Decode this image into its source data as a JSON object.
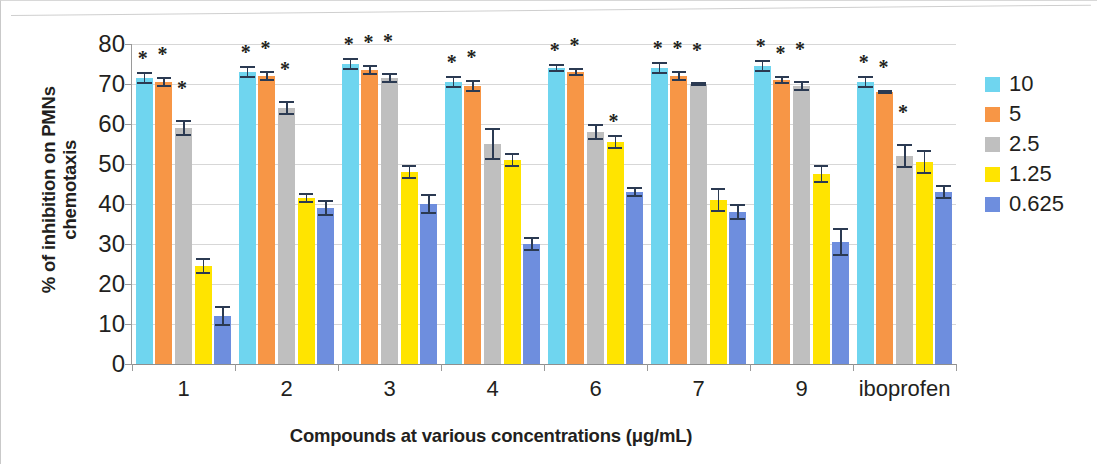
{
  "chart_data": {
    "type": "bar",
    "title": "",
    "xlabel": "Compounds at various concentrations (μg/mL)",
    "ylabel": "% of inhibition on PMNs chemotaxis",
    "ylabel_line1": "% of inhibition on PMNs",
    "ylabel_line2": "chemotaxis",
    "categories": [
      "1",
      "2",
      "3",
      "4",
      "6",
      "7",
      "9",
      "iboprofen"
    ],
    "ylim": [
      0,
      80
    ],
    "yticks": [
      0,
      10,
      20,
      30,
      40,
      50,
      60,
      70,
      80
    ],
    "grid": true,
    "legend_position": "right",
    "legend_title": "",
    "series": [
      {
        "name": "10",
        "color": "#6fd5ef",
        "values": [
          71.5,
          73.0,
          75.0,
          70.5,
          74.0,
          74.0,
          74.5,
          70.5
        ],
        "errors": [
          1.5,
          1.5,
          1.5,
          1.5,
          1.0,
          1.5,
          1.5,
          1.5
        ],
        "significance": [
          "*",
          "*",
          "*",
          "*",
          "*",
          "*",
          "*",
          "*"
        ]
      },
      {
        "name": "5",
        "color": "#f79646",
        "values": [
          70.5,
          72.0,
          73.5,
          69.5,
          73.0,
          72.0,
          71.0,
          68.0
        ],
        "errors": [
          1.2,
          1.2,
          1.2,
          1.5,
          1.0,
          1.2,
          1.0,
          0.4
        ],
        "significance": [
          "*",
          "*",
          "*",
          "*",
          "*",
          "*",
          "*",
          "*"
        ]
      },
      {
        "name": "2.5",
        "color": "#bfbfbf",
        "values": [
          59.0,
          64.0,
          71.5,
          55.0,
          58.0,
          70.0,
          69.5,
          52.0
        ],
        "errors": [
          2.0,
          1.8,
          1.3,
          4.0,
          2.0,
          0.4,
          1.3,
          3.0
        ],
        "significance": [
          "*",
          "*",
          "*",
          "",
          "",
          "*",
          "*",
          "*"
        ]
      },
      {
        "name": "1.25",
        "color": "#ffe400",
        "values": [
          24.5,
          41.5,
          48.0,
          51.0,
          55.5,
          41.0,
          47.5,
          50.5
        ],
        "errors": [
          2.0,
          1.3,
          1.8,
          1.8,
          1.8,
          3.0,
          2.2,
          3.0
        ],
        "significance": [
          "",
          "",
          "",
          "",
          "*",
          "",
          "",
          ""
        ]
      },
      {
        "name": "0.625",
        "color": "#6e8ede",
        "values": [
          12.0,
          39.0,
          40.0,
          30.0,
          43.0,
          38.0,
          30.5,
          43.0
        ],
        "errors": [
          2.5,
          2.0,
          2.5,
          1.8,
          1.3,
          2.0,
          3.5,
          1.8
        ],
        "significance": [
          "",
          "",
          "",
          "",
          "",
          "",
          "",
          ""
        ]
      }
    ]
  },
  "legend": {
    "items": [
      {
        "label": "10",
        "color": "#6fd5ef"
      },
      {
        "label": "5",
        "color": "#f79646"
      },
      {
        "label": "2.5",
        "color": "#bfbfbf"
      },
      {
        "label": "1.25",
        "color": "#ffe400"
      },
      {
        "label": "0.625",
        "color": "#6e8ede"
      }
    ]
  }
}
